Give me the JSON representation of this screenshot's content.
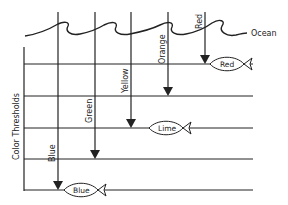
{
  "diagram": {
    "ocean_label": "Ocean",
    "axis_label": "Color Thresholds",
    "colors": {
      "stroke": "#222222",
      "background": "#ffffff"
    },
    "thresholds": [
      {
        "y": 64
      },
      {
        "y": 96
      },
      {
        "y": 128
      },
      {
        "y": 159
      },
      {
        "y": 190
      }
    ],
    "arrows": [
      {
        "label": "Blue",
        "x": 58,
        "y_end": 190
      },
      {
        "label": "Green",
        "x": 95,
        "y_end": 159
      },
      {
        "label": "Yellow",
        "x": 131,
        "y_end": 128
      },
      {
        "label": "Orange",
        "x": 168,
        "y_end": 96
      },
      {
        "label": "Red",
        "x": 205,
        "y_end": 64
      }
    ],
    "fish": [
      {
        "label": "Red",
        "x": 210,
        "y": 64
      },
      {
        "label": "Lime",
        "x": 149,
        "y": 128
      },
      {
        "label": "Blue",
        "x": 64,
        "y": 190
      }
    ]
  }
}
